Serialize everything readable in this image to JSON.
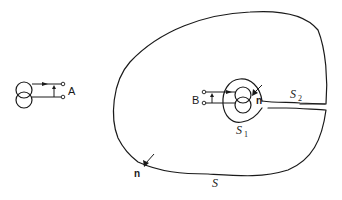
{
  "diagram": {
    "type": "surface-integration-two-port-transformer",
    "colors": {
      "stroke": "#1a1a1a",
      "background": "#ffffff"
    },
    "left_element": {
      "symbol": "transformer (two overlapping circles) with port",
      "port_label": "A"
    },
    "right_element": {
      "symbol": "transformer (two overlapping circles) with port",
      "port_label": "B"
    },
    "surfaces": {
      "outer": {
        "label": "S"
      },
      "inner": {
        "label": "S",
        "subscript": "1"
      },
      "connecting_tube": {
        "label": "S",
        "subscript": "2"
      }
    },
    "normals": {
      "outer_normal_label": "n",
      "inner_normal_label": "n"
    }
  }
}
